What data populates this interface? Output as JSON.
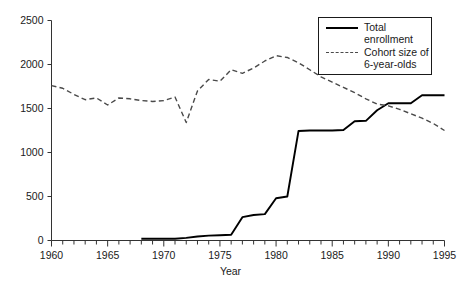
{
  "chart_data": {
    "type": "line",
    "title": "",
    "xlabel": "Year",
    "ylabel": "",
    "xlim": [
      1960,
      1995
    ],
    "ylim": [
      0,
      2500
    ],
    "xticks": [
      1960,
      1965,
      1970,
      1975,
      1980,
      1985,
      1990,
      1995
    ],
    "xtick_labels": [
      "1960",
      "1965",
      "1970",
      "1975",
      "1980",
      "1985",
      "1990",
      "1995"
    ],
    "xminor_tick_step": 1,
    "yticks": [
      0,
      500,
      1000,
      1500,
      2000,
      2500
    ],
    "ytick_labels": [
      "0",
      "500",
      "1000",
      "1500",
      "2000",
      "2500"
    ],
    "grid": false,
    "legend_position": "upper right",
    "x": [
      1960,
      1961,
      1962,
      1963,
      1964,
      1965,
      1966,
      1967,
      1968,
      1969,
      1970,
      1971,
      1972,
      1973,
      1974,
      1975,
      1976,
      1977,
      1978,
      1979,
      1980,
      1981,
      1982,
      1983,
      1984,
      1985,
      1986,
      1987,
      1988,
      1989,
      1990,
      1991,
      1992,
      1993,
      1994,
      1995
    ],
    "series": [
      {
        "name": "Total enrollment",
        "style": "solid",
        "color": "#000000",
        "x": [
          1968,
          1969,
          1970,
          1971,
          1972,
          1973,
          1974,
          1975,
          1976,
          1977,
          1978,
          1979,
          1980,
          1981,
          1982,
          1983,
          1984,
          1985,
          1986,
          1987,
          1988,
          1989,
          1990,
          1991,
          1992,
          1993,
          1994,
          1995
        ],
        "values": [
          20,
          20,
          20,
          20,
          30,
          45,
          55,
          60,
          65,
          265,
          290,
          300,
          480,
          500,
          1245,
          1250,
          1250,
          1250,
          1255,
          1355,
          1360,
          1480,
          1560,
          1560,
          1560,
          1650,
          1650,
          1650
        ]
      },
      {
        "name": "Cohort size of 6-year-olds",
        "style": "dashed",
        "color": "#4a4a4a",
        "x": [
          1960,
          1961,
          1962,
          1963,
          1964,
          1965,
          1966,
          1967,
          1968,
          1969,
          1970,
          1971,
          1972,
          1973,
          1974,
          1975,
          1976,
          1977,
          1978,
          1979,
          1980,
          1981,
          1982,
          1983,
          1984,
          1985,
          1986,
          1987,
          1988,
          1989,
          1990,
          1991,
          1992,
          1993,
          1994,
          1995
        ],
        "values": [
          1760,
          1730,
          1660,
          1600,
          1620,
          1540,
          1620,
          1610,
          1590,
          1580,
          1590,
          1630,
          1340,
          1700,
          1830,
          1810,
          1940,
          1900,
          1960,
          2040,
          2100,
          2080,
          2020,
          1940,
          1860,
          1800,
          1740,
          1680,
          1610,
          1550,
          1530,
          1490,
          1440,
          1390,
          1330,
          1250
        ]
      }
    ],
    "legend": [
      {
        "label": "Total\nenrollment",
        "style": "solid"
      },
      {
        "label": "Cohort size of\n6-year-olds",
        "style": "dashed"
      }
    ]
  }
}
